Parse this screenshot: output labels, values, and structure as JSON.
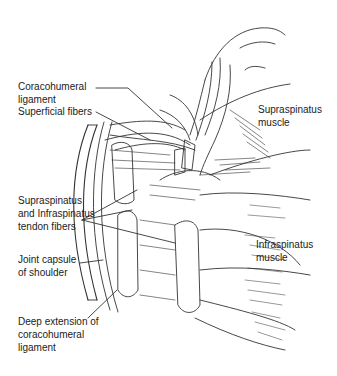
{
  "diagram": {
    "labels": {
      "coracohumeral_ligament": [
        "Coracohumeral",
        "ligament"
      ],
      "superficial_fibers": "Superficial fibers",
      "supraspinatus_muscle": [
        "Supraspinatus",
        "muscle"
      ],
      "tendon_fibers": [
        "Supraspinatus",
        "and Infraspinatus",
        "tendon fibers"
      ],
      "infraspinatus_muscle": [
        "Infraspinatus",
        "muscle"
      ],
      "joint_capsule": [
        "Joint capsule",
        "of shoulder"
      ],
      "deep_extension": [
        "Deep extension of",
        "coracohumeral",
        "ligament"
      ]
    },
    "colors": {
      "line": "#333333",
      "text": "#222222",
      "background": "#ffffff"
    }
  }
}
